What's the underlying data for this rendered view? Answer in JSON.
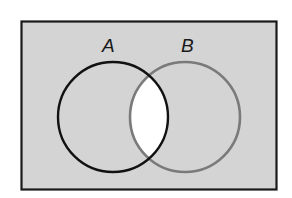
{
  "diagram": {
    "type": "venn",
    "universe": {
      "x": 21,
      "y": 21,
      "width": 256,
      "height": 169,
      "fill": "#d4d4d4",
      "stroke": "#1a1a1a"
    },
    "sets": [
      {
        "label": "A",
        "cx": 113,
        "cy": 117,
        "r": 55,
        "stroke": "#111111",
        "label_x": 108,
        "label_y": 52
      },
      {
        "label": "B",
        "cx": 185,
        "cy": 117,
        "r": 55,
        "stroke": "#7a7a7a",
        "label_x": 188,
        "label_y": 52
      }
    ],
    "intersection_fill": "#ffffff"
  }
}
